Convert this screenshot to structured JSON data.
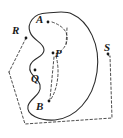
{
  "figure": {
    "background_color": "#ffffff",
    "stroke_color": "#2b2b2b",
    "label_color": "#1a1a1a",
    "width": 123,
    "height": 138,
    "labels": {
      "A": "A",
      "P": "P",
      "Q": "Q",
      "B": "B",
      "R": "R",
      "S": "S"
    },
    "points": [
      {
        "name": "A",
        "label": "A",
        "x": 48,
        "y": 22,
        "inside": true
      },
      {
        "name": "P",
        "label": "P",
        "x": 53,
        "y": 53,
        "inside": true
      },
      {
        "name": "Q",
        "label": "Q",
        "x": 35,
        "y": 70,
        "inside": true
      },
      {
        "name": "B",
        "label": "B",
        "x": 49,
        "y": 101,
        "inside": true
      },
      {
        "name": "R",
        "label": "R",
        "x": 26,
        "y": 38,
        "inside": false
      },
      {
        "name": "S",
        "label": "S",
        "x": 109,
        "y": 55,
        "inside": false
      }
    ],
    "curves": {
      "region_outline": "solid closed concave kidney curve",
      "path_A_to_P": "dashed arc from A curving right then down to P",
      "path_P_to_B": "dashed segment from P down-left to B",
      "path_R": "dashed segment from R going down-left to polygon vertex",
      "path_S": "dashed segment from S going down to polygon corner",
      "polygon": "dashed open polygon enclosing the region on the left, bottom and right"
    }
  }
}
